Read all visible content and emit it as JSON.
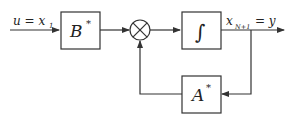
{
  "diagram": {
    "type": "block-diagram",
    "input": {
      "label": "u = x",
      "subscript": "1"
    },
    "blocks": [
      {
        "id": "B",
        "label": "B",
        "superscript": "*"
      },
      {
        "id": "integrator",
        "label": "∫"
      },
      {
        "id": "A",
        "label": "A",
        "superscript": "*"
      }
    ],
    "summing_junction": {
      "symbol": "⊗"
    },
    "output": {
      "label_x": "x",
      "subscript": "N+1",
      "label_eq": "= y"
    },
    "colors": {
      "stroke": "#333333",
      "background": "#ffffff"
    }
  }
}
